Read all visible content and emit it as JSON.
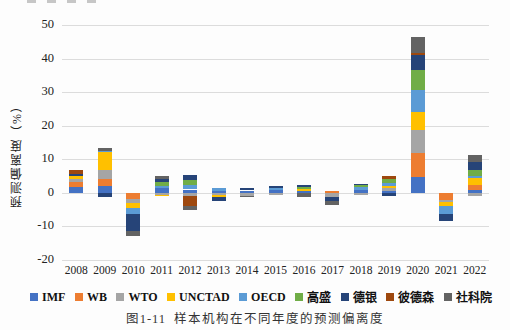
{
  "y_axis_label": "预测偏离度（%）",
  "caption": "图1-11  样本机构在不同年度的预测偏离度",
  "chart_data": {
    "type": "bar",
    "subtype": "stacked",
    "title": "图1-11  样本机构在不同年度的预测偏离度",
    "ylabel": "预测偏离度（%）",
    "xlabel": "",
    "ylim": [
      -20,
      50
    ],
    "yticks": [
      50,
      40,
      30,
      20,
      10,
      0,
      -10,
      -20
    ],
    "grid": true,
    "legend_position": "bottom",
    "categories": [
      "2008",
      "2009",
      "2010",
      "2011",
      "2012",
      "2013",
      "2014",
      "2015",
      "2016",
      "2017",
      "2018",
      "2019",
      "2020",
      "2021",
      "2022"
    ],
    "series": [
      {
        "name": "IMF",
        "color": "#4472C4",
        "values": [
          1.8,
          2.1,
          0.0,
          1.4,
          1.0,
          0.6,
          0.7,
          0.8,
          0.6,
          0.0,
          0.9,
          0.6,
          4.8,
          0.0,
          0.9
        ]
      },
      {
        "name": "WB",
        "color": "#ED7D31",
        "values": [
          1.3,
          2.1,
          -1.8,
          0.0,
          0.0,
          0.0,
          0.0,
          0.0,
          0.0,
          0.5,
          0.0,
          0.0,
          7.1,
          -2.0,
          1.5
        ]
      },
      {
        "name": "WTO",
        "color": "#A5A5A5",
        "values": [
          1.0,
          2.6,
          -1.2,
          -0.7,
          -0.8,
          -0.5,
          -0.8,
          -0.5,
          0.0,
          -1.2,
          -0.5,
          0.9,
          6.9,
          -0.7,
          -1.0
        ]
      },
      {
        "name": "UNCTAD",
        "color": "#FFC000",
        "values": [
          1.0,
          5.4,
          -1.6,
          -0.3,
          0.0,
          -0.8,
          0.0,
          0.0,
          0.6,
          0.0,
          0.0,
          0.4,
          5.3,
          -1.3,
          2.1
        ]
      },
      {
        "name": "OECD",
        "color": "#5B9BD5",
        "values": [
          0.0,
          0.4,
          -1.6,
          0.5,
          1.2,
          0.9,
          0.0,
          0.6,
          0.0,
          0.0,
          0.8,
          1.1,
          6.6,
          -2.2,
          0.4
        ]
      },
      {
        "name": "高盛",
        "color": "#70AD47",
        "values": [
          0.0,
          0.0,
          0.0,
          1.2,
          1.6,
          0.0,
          0.0,
          0.0,
          0.5,
          0.0,
          0.5,
          1.0,
          5.9,
          0.0,
          1.8
        ]
      },
      {
        "name": "德银",
        "color": "#264478",
        "values": [
          0.5,
          -1.2,
          -5.2,
          1.0,
          1.6,
          -1.2,
          0.8,
          0.6,
          0.5,
          -1.3,
          0.4,
          -1.0,
          4.5,
          -2.3,
          2.4
        ]
      },
      {
        "name": "彼德森",
        "color": "#9E480E",
        "values": [
          1.2,
          0.0,
          0.0,
          0.0,
          -3.2,
          0.0,
          0.0,
          0.0,
          0.0,
          0.0,
          0.0,
          1.0,
          0.5,
          0.0,
          0.0
        ]
      },
      {
        "name": "社科院",
        "color": "#636363",
        "values": [
          0.0,
          0.8,
          -1.4,
          0.9,
          -1.0,
          0.0,
          -0.4,
          0.0,
          -1.3,
          -1.0,
          0.0,
          0.0,
          4.8,
          0.0,
          2.2
        ]
      }
    ]
  }
}
